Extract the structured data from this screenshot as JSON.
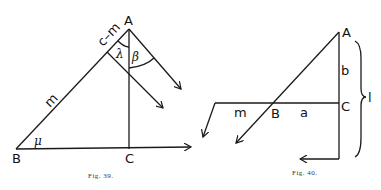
{
  "figures": [
    {
      "caption": "Fig. 39.",
      "points": {
        "A": "A",
        "B": "B",
        "C": "C"
      },
      "segment_labels": {
        "upper": "c–m",
        "lower": "m"
      },
      "angle_labels": {
        "lambda": "λ",
        "beta": "β",
        "mu": "μ"
      }
    },
    {
      "caption": "Fig. 40.",
      "points": {
        "A": "A",
        "B": "B",
        "C": "C"
      },
      "segment_labels": {
        "m": "m",
        "a": "a",
        "b": "b",
        "l": "l"
      }
    }
  ]
}
